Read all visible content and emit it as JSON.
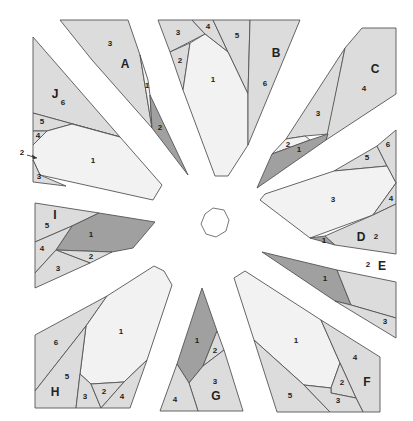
{
  "diagram": {
    "colors": {
      "light": "#f2f2f2",
      "medium": "#dcdcdc",
      "dark": "#a0a0a0",
      "stroke": "#555555",
      "text": "#222222"
    },
    "center": {
      "shape": "octagon",
      "points": "205,214 213,208 224,210 229,220 226,231 216,237 206,234 201,224"
    },
    "sections": [
      {
        "id": "A",
        "label": "A",
        "label_pos": [
          125,
          65
        ],
        "pieces": [
          {
            "n": "3",
            "tone": "medium",
            "points": "60,20 128,20 140,55 152,128 92,60",
            "lpos": [
              110,
              44
            ]
          },
          {
            "n": "1",
            "tone": "light",
            "points": "140,55 148,80 150,95 152,128",
            "lpos": [
              147,
              86
            ]
          },
          {
            "n": "2",
            "tone": "dark",
            "points": "150,95 188,175 152,128",
            "lpos": [
              160,
              128
            ]
          }
        ]
      },
      {
        "id": "B",
        "label": "B",
        "label_pos": [
          276,
          54
        ],
        "pieces": [
          {
            "n": "3",
            "tone": "medium",
            "points": "158,20 192,20 205,34 170,52",
            "lpos": [
              178,
              33
            ]
          },
          {
            "n": "4",
            "tone": "medium",
            "points": "192,20 213,20 228,52 205,34",
            "lpos": [
              208,
              27
            ]
          },
          {
            "n": "5",
            "tone": "medium",
            "points": "213,20 250,20 248,94 228,52",
            "lpos": [
              237,
              36
            ]
          },
          {
            "n": "2",
            "tone": "medium",
            "points": "170,52 190,43 183,90",
            "lpos": [
              180,
              61
            ]
          },
          {
            "n": "1",
            "tone": "light",
            "points": "205,34 228,52 248,94 248,145 228,176 215,176 183,90 190,43",
            "lpos": [
              213,
              80
            ]
          },
          {
            "n": "6",
            "tone": "medium",
            "points": "250,20 300,20 248,145 248,94",
            "lpos": [
              265,
              84
            ]
          }
        ]
      },
      {
        "id": "C",
        "label": "C",
        "label_pos": [
          375,
          70
        ],
        "pieces": [
          {
            "n": "3",
            "tone": "medium",
            "points": "345,48 328,134 305,136 286,139",
            "lpos": [
              318,
              114
            ]
          },
          {
            "n": "4",
            "tone": "medium",
            "points": "362,28 396,28 396,94 326,140 345,48",
            "lpos": [
              364,
              89
            ]
          },
          {
            "n": "2",
            "tone": "light",
            "points": "286,139 305,136 310,140 272,154",
            "lpos": [
              288,
              145
            ]
          },
          {
            "n": "1",
            "tone": "dark",
            "points": "272,154 310,140 328,134 326,140 257,188",
            "lpos": [
              299,
              150
            ]
          }
        ]
      },
      {
        "id": "D",
        "label": "D",
        "label_pos": [
          361,
          238
        ],
        "pieces": [
          {
            "n": "5",
            "tone": "medium",
            "points": "334,171 377,146 387,166",
            "lpos": [
              367,
              158
            ]
          },
          {
            "n": "6",
            "tone": "medium",
            "points": "377,146 396,130 396,183 387,166",
            "lpos": [
              388,
              145
            ]
          },
          {
            "n": "3",
            "tone": "light",
            "points": "334,171 387,166 396,183 373,215 310,238 260,200 265,194",
            "lpos": [
              333,
              200
            ]
          },
          {
            "n": "4",
            "tone": "medium",
            "points": "396,183 396,204 373,215",
            "lpos": [
              391,
              199
            ]
          },
          {
            "n": "1",
            "tone": "dark",
            "points": "310,238 325,236 335,245",
            "lpos": [
              324,
              241
            ]
          },
          {
            "n": "2",
            "tone": "medium",
            "points": "373,215 396,204 396,254 335,245 325,236",
            "lpos": [
              376,
              237
            ]
          }
        ]
      },
      {
        "id": "E",
        "label": "E",
        "label_pos": [
          382,
          267
        ],
        "pieces": [
          {
            "n": "1",
            "tone": "dark",
            "points": "262,252 337,270 351,305 335,301",
            "lpos": [
              325,
              279
            ]
          },
          {
            "n": "2",
            "tone": "medium",
            "points": "337,270 396,282 396,318 351,305",
            "lpos": [
              368,
              265
            ]
          },
          {
            "n": "3",
            "tone": "medium",
            "points": "335,301 351,305 396,318 396,338",
            "lpos": [
              385,
              322
            ]
          }
        ]
      },
      {
        "id": "F",
        "label": "F",
        "label_pos": [
          367,
          383
        ],
        "pieces": [
          {
            "n": "1",
            "tone": "light",
            "points": "234,278 245,271 321,320 340,363 331,388 304,385 254,340",
            "lpos": [
              296,
              341
            ]
          },
          {
            "n": "4",
            "tone": "medium",
            "points": "321,320 380,357 380,412 363,412 356,398 340,363",
            "lpos": [
              355,
              358
            ]
          },
          {
            "n": "2",
            "tone": "medium",
            "points": "340,363 356,398 331,393 331,388",
            "lpos": [
              342,
              383
            ]
          },
          {
            "n": "5",
            "tone": "medium",
            "points": "254,340 304,385 330,412 277,412",
            "lpos": [
              290,
              396
            ]
          },
          {
            "n": "3",
            "tone": "medium",
            "points": "304,385 331,388 331,393 356,398 363,412 330,412",
            "lpos": [
              338,
              401
            ]
          }
        ]
      },
      {
        "id": "G",
        "label": "G",
        "label_pos": [
          216,
          397
        ],
        "pieces": [
          {
            "n": "1",
            "tone": "dark",
            "points": "202,288 217,331 203,366 189,383 177,364",
            "lpos": [
              197,
              341
            ]
          },
          {
            "n": "2",
            "tone": "medium",
            "points": "217,331 224,350 203,366",
            "lpos": [
              215,
              351
            ]
          },
          {
            "n": "3",
            "tone": "medium",
            "points": "224,350 243,411 198,411 189,383 203,366",
            "lpos": [
              215,
              382
            ]
          },
          {
            "n": "4",
            "tone": "medium",
            "points": "177,364 189,383 198,411 160,411",
            "lpos": [
              175,
              400
            ]
          }
        ]
      },
      {
        "id": "H",
        "label": "H",
        "label_pos": [
          55,
          393
        ],
        "pieces": [
          {
            "n": "6",
            "tone": "medium",
            "points": "35,335 107,296 86,326 35,391",
            "lpos": [
              56,
              343
            ]
          },
          {
            "n": "1",
            "tone": "light",
            "points": "107,296 154,266 164,271 172,285 147,360 124,382 91,384 80,374 86,326",
            "lpos": [
              121,
              332
            ]
          },
          {
            "n": "5",
            "tone": "medium",
            "points": "35,391 86,326 80,374 76,408 35,408",
            "lpos": [
              67,
              377
            ]
          },
          {
            "n": "3",
            "tone": "medium",
            "points": "80,374 91,384 101,408 76,408",
            "lpos": [
              85,
              397
            ]
          },
          {
            "n": "2",
            "tone": "medium",
            "points": "91,384 124,382 101,408",
            "lpos": [
              104,
              392
            ]
          },
          {
            "n": "4",
            "tone": "medium",
            "points": "124,382 147,360 130,408 101,408",
            "lpos": [
              122,
              397
            ]
          }
        ]
      },
      {
        "id": "I",
        "label": "I",
        "label_pos": [
          55,
          216
        ],
        "pieces": [
          {
            "n": "5",
            "tone": "medium",
            "points": "35,203 99,213 72,226 35,242",
            "lpos": [
              47,
              226
            ]
          },
          {
            "n": "1",
            "tone": "dark",
            "points": "72,226 99,213 155,222 133,248 112,252 56,250",
            "lpos": [
              91,
              235
            ]
          },
          {
            "n": "4",
            "tone": "medium",
            "points": "35,242 72,226 56,250 35,273",
            "lpos": [
              42,
              249
            ]
          },
          {
            "n": "2",
            "tone": "medium",
            "points": "56,250 112,252 90,263",
            "lpos": [
              91,
              257
            ]
          },
          {
            "n": "3",
            "tone": "medium",
            "points": "35,273 56,250 90,263 35,288",
            "lpos": [
              58,
              269
            ]
          }
        ]
      },
      {
        "id": "J",
        "label": "J",
        "label_pos": [
          55,
          95
        ],
        "pieces": [
          {
            "n": "6",
            "tone": "medium",
            "points": "33,37 120,137 33,113",
            "lpos": [
              63,
              103
            ]
          },
          {
            "n": "5",
            "tone": "medium",
            "points": "33,113 120,137 72,124 47,131 33,131",
            "lpos": [
              42,
              122
            ]
          },
          {
            "n": "4",
            "tone": "medium",
            "points": "33,131 47,131 33,145",
            "lpos": [
              38,
              136
            ]
          },
          {
            "n": "1",
            "tone": "light",
            "points": "47,131 72,124 120,137 162,185 153,200 40,175 33,160 33,145",
            "lpos": [
              93,
              161
            ]
          },
          {
            "n": "3",
            "tone": "medium",
            "points": "33,160 40,175 66,186 33,182",
            "lpos": [
              39,
              177
            ]
          }
        ]
      }
    ],
    "callout": {
      "text": "2",
      "text_pos": [
        22,
        153
      ],
      "arrow_from": [
        27,
        155
      ],
      "arrow_to": [
        37,
        158
      ]
    }
  }
}
